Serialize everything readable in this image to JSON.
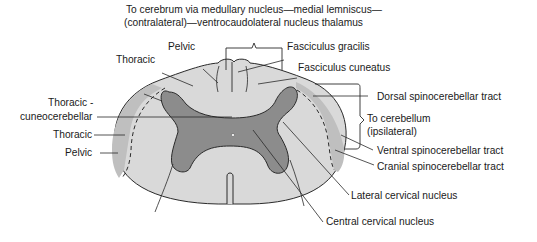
{
  "diagram": {
    "type": "anatomical cross-section",
    "colors": {
      "outer_white_matter": "#d9d9d9",
      "lateral_tract_band": "#bfbfbf",
      "gray_matter": "#8c8c8c",
      "outline": "#2a2a2a",
      "background": "#ffffff"
    },
    "top_caption": {
      "line1": "To cerebrum via medullary nucleus—medial lemniscus—",
      "line2": "(contralateral)—ventrocaudolateral nucleus thalamus"
    },
    "labels_left": {
      "pelvic_top": "Pelvic",
      "thoracic_top": "Thoracic",
      "thoracic_cuneo_line1": "Thoracic -",
      "thoracic_cuneo_line2": "cuneocerebellar",
      "thoracic_side": "Thoracic",
      "pelvic_side": "Pelvic"
    },
    "labels_right": {
      "fasciculus_gracilis": "Fasciculus gracilis",
      "fasciculus_cuneatus": "Fasciculus cuneatus",
      "dorsal_spinocerebellar": "Dorsal spinocerebellar tract",
      "to_cerebellum_line1": "To cerebellum",
      "to_cerebellum_line2": "(ipsilateral)",
      "ventral_spinocerebellar": "Ventral spinocerebellar tract",
      "cranial_spinocerebellar": "Cranial spinocerebellar tract",
      "lateral_cervical_nucleus": "Lateral cervical nucleus",
      "central_cervical_nucleus": "Central cervical nucleus"
    }
  }
}
